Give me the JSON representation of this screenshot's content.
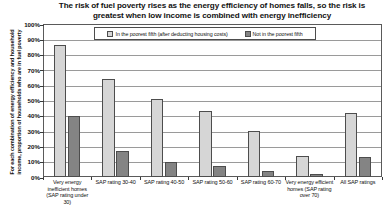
{
  "chart_data": {
    "type": "bar",
    "title": "The risk of fuel poverty rises as the energy efficiency of homes falls, so the risk is greatest when low income is combined with energy inefficiency",
    "xlabel": "",
    "ylabel": "For each combination of energy efficiency and household income, proportion of households who are in fuel poverty",
    "ylim": [
      0,
      100
    ],
    "yticks": [
      "0%",
      "10%",
      "20%",
      "30%",
      "40%",
      "50%",
      "60%",
      "70%",
      "80%",
      "90%",
      "100%"
    ],
    "ytick_values": [
      0,
      10,
      20,
      30,
      40,
      50,
      60,
      70,
      80,
      90,
      100
    ],
    "grid": true,
    "legend_position": "top-center",
    "categories": [
      "Very energy inefficient homes (SAP rating under 30)",
      "SAP rating 30-40",
      "SAP rating 40-50",
      "SAP rating 50-60",
      "SAP rating 60-70",
      "Very energy efficient homes (SAP rating over 70)",
      "All SAP ratings"
    ],
    "series": [
      {
        "name": "In the poorest fifth (after deducting housing costs)",
        "color": "#d6d6d6",
        "values": [
          86,
          64,
          51,
          43,
          30,
          14,
          42
        ]
      },
      {
        "name": "Not in the poorest fifth",
        "color": "#848484",
        "values": [
          40,
          17,
          10,
          7,
          4,
          2,
          13
        ]
      }
    ]
  },
  "axis": {
    "y_caption_line1": "For each combination of energy efficiency and household",
    "y_caption_line2": "income, proportion of households who are in fuel poverty"
  }
}
